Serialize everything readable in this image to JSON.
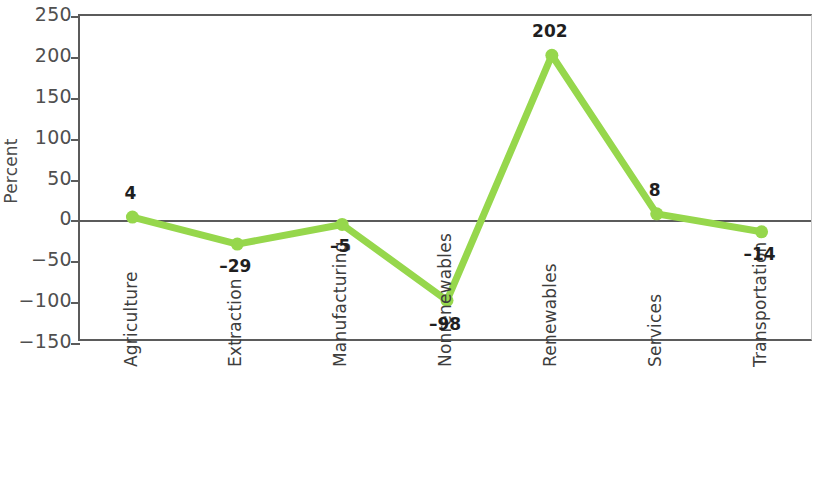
{
  "chart_data": {
    "type": "line",
    "title": "",
    "subtitle": "",
    "xlabel": "",
    "ylabel": "Percent",
    "categories": [
      "Agriculture",
      "Extraction",
      "Manufacturing",
      "Nonrenewables",
      "Renewables",
      "Services",
      "Transportation"
    ],
    "values": [
      4,
      -29,
      -5,
      -98,
      202,
      8,
      -14
    ],
    "point_labels": [
      "4",
      "–29",
      "–5",
      "–98",
      "202",
      "8",
      "–14"
    ],
    "series": [
      {
        "name": "Percent change",
        "values": [
          4,
          -29,
          -5,
          -98,
          202,
          8,
          -14
        ]
      }
    ],
    "ylim": [
      -150,
      250
    ],
    "yticks": [
      250,
      200,
      150,
      100,
      50,
      0,
      -50,
      -100,
      -150
    ],
    "ytick_labels": [
      "250",
      "200",
      "150",
      "100",
      "50",
      "0",
      "−50",
      "−100",
      "−150"
    ],
    "grid": false,
    "legend": "none",
    "zero_line": true,
    "colors": {
      "series": "#96D74C",
      "axis": "#5b5b5b",
      "tick_text": "#4f4f4f",
      "label_text": "#1f1f1f",
      "background": "#ffffff"
    },
    "marker": "circle",
    "label_offsets_px": [
      -22,
      24,
      24,
      26,
      -22,
      -22,
      24
    ]
  }
}
